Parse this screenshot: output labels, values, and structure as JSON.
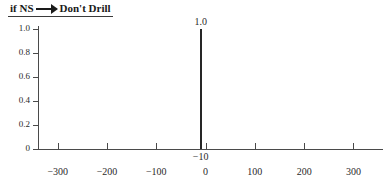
{
  "title": {
    "prefix": "if NS",
    "arrow_icon": "right-arrow-icon",
    "suffix": "Don't Drill"
  },
  "chart_data": {
    "type": "bar",
    "xlabel": "",
    "ylabel": "",
    "x": [
      -10
    ],
    "values": [
      1.0
    ],
    "point_labels": [
      "1.0"
    ],
    "point_x_labels": [
      "−10"
    ],
    "xlim": [
      -340,
      360
    ],
    "ylim": [
      0,
      1.12
    ],
    "grid": false,
    "legend": null,
    "x_ticks": [
      -300,
      -200,
      -100,
      0,
      100,
      200,
      300
    ],
    "x_tick_labels": [
      "−300",
      "−200",
      "−100",
      "0",
      "100",
      "200",
      "300"
    ],
    "y_ticks": [
      0,
      0.2,
      0.4,
      0.6,
      0.8,
      1.0
    ],
    "y_tick_labels": [
      "0",
      "0.2",
      "0.4",
      "0.6",
      "0.8",
      "1.0"
    ],
    "colors": {
      "spike": "#262626",
      "axis": "#4a4a4a",
      "text": "#2a2a2a"
    }
  }
}
